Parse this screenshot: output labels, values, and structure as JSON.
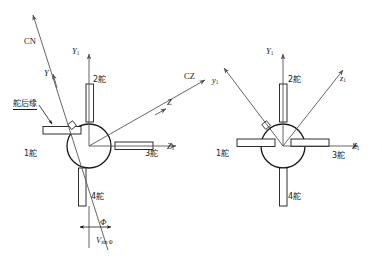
{
  "figure": {
    "title": "",
    "background_color": "#ffffff",
    "line_color": "#1a1a1a",
    "axis_color": "#555555",
    "text_color": "#1a1a1a"
  },
  "left_diagram": {
    "name": "left-diagram",
    "fins": [
      {
        "id": "fin-1",
        "label": "1舵",
        "position": "left"
      },
      {
        "id": "fin-2",
        "label": "2舵",
        "position": "top"
      },
      {
        "id": "fin-3",
        "label": "3舵",
        "position": "right"
      },
      {
        "id": "fin-4",
        "label": "4舵",
        "position": "bottom"
      }
    ],
    "axes": [
      {
        "id": "axis-Y1",
        "label_main": "Y",
        "label_sub": "1",
        "style": "italic",
        "direction": "up"
      },
      {
        "id": "axis-Z1",
        "label_main": "Z",
        "label_sub": "1",
        "style": "italic",
        "direction": "right"
      },
      {
        "id": "axis-Z",
        "label_main": "Z",
        "label_sub": "",
        "style": "italic",
        "direction": "upper-right"
      },
      {
        "id": "axis-Y",
        "label_main": "Y",
        "label_sub": "",
        "style": "italic",
        "direction": "upper-left"
      }
    ],
    "force_labels": [
      {
        "id": "force-CN",
        "label": "CN",
        "style": "upright"
      },
      {
        "id": "force-CZ",
        "label": "CZ",
        "style": "upright"
      }
    ],
    "annotations": [
      {
        "id": "trailing-edge-callout",
        "label": "舵后缘",
        "underlined": true
      },
      {
        "id": "roll-angle",
        "label": "Φ",
        "style": "italic"
      },
      {
        "id": "velocity-vector",
        "label_main": "V",
        "label_sub": "sin Φ",
        "style": "italic"
      }
    ]
  },
  "right_diagram": {
    "name": "right-diagram",
    "fins": [
      {
        "id": "fin-1",
        "label": "1舵",
        "position": "left"
      },
      {
        "id": "fin-2",
        "label": "2舵",
        "position": "top"
      },
      {
        "id": "fin-3",
        "label": "3舵",
        "position": "right"
      },
      {
        "id": "fin-4",
        "label": "4舵",
        "position": "bottom"
      }
    ],
    "axes": [
      {
        "id": "axis-Y1",
        "label_main": "Y",
        "label_sub": "1",
        "style": "italic",
        "direction": "up"
      },
      {
        "id": "axis-Z1",
        "label_main": "Z",
        "label_sub": "1",
        "style": "italic",
        "direction": "right"
      },
      {
        "id": "axis-y1",
        "label_main": "y",
        "label_sub": "1",
        "style": "italic",
        "direction": "upper-left"
      },
      {
        "id": "axis-z1",
        "label_main": "z",
        "label_sub": "1",
        "style": "italic",
        "direction": "upper-right"
      }
    ]
  },
  "labels": {
    "fin1": "1舵",
    "fin2": "2舵",
    "fin3": "3舵",
    "fin4": "4舵",
    "trailing_edge": "舵后缘",
    "CN": "CN",
    "CZ": "CZ",
    "Y": "Y",
    "Z": "Z",
    "Y_cap": "Y",
    "Z_cap": "Z",
    "y_low": "y",
    "z_low": "z",
    "sub1": "1",
    "phi": "Φ",
    "V": "V",
    "V_sub": "sin Φ"
  }
}
